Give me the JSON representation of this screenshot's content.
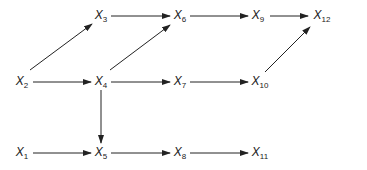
{
  "diagram": {
    "type": "directed-graph",
    "stroke_color": "#222222",
    "background": "#ffffff",
    "nodes": [
      {
        "id": "X1",
        "base": "X",
        "sub": "1",
        "x": 22,
        "y": 153
      },
      {
        "id": "X2",
        "base": "X",
        "sub": "2",
        "x": 22,
        "y": 82
      },
      {
        "id": "X3",
        "base": "X",
        "sub": "3",
        "x": 101,
        "y": 16
      },
      {
        "id": "X4",
        "base": "X",
        "sub": "4",
        "x": 101,
        "y": 82
      },
      {
        "id": "X5",
        "base": "X",
        "sub": "5",
        "x": 101,
        "y": 153
      },
      {
        "id": "X6",
        "base": "X",
        "sub": "6",
        "x": 180,
        "y": 16
      },
      {
        "id": "X7",
        "base": "X",
        "sub": "7",
        "x": 180,
        "y": 82
      },
      {
        "id": "X8",
        "base": "X",
        "sub": "8",
        "x": 180,
        "y": 153
      },
      {
        "id": "X9",
        "base": "X",
        "sub": "9",
        "x": 258,
        "y": 16
      },
      {
        "id": "X10",
        "base": "X",
        "sub": "10",
        "x": 260,
        "y": 82
      },
      {
        "id": "X11",
        "base": "X",
        "sub": "11",
        "x": 260,
        "y": 153
      },
      {
        "id": "X12",
        "base": "X",
        "sub": "12",
        "x": 322,
        "y": 16
      }
    ],
    "edges": [
      {
        "from": "X2",
        "to": "X3",
        "x1": 30,
        "y1": 70,
        "x2": 92,
        "y2": 24
      },
      {
        "from": "X2",
        "to": "X4",
        "x1": 33,
        "y1": 82,
        "x2": 91,
        "y2": 82
      },
      {
        "from": "X3",
        "to": "X6",
        "x1": 111,
        "y1": 16,
        "x2": 170,
        "y2": 16
      },
      {
        "from": "X4",
        "to": "X6",
        "x1": 110,
        "y1": 70,
        "x2": 170,
        "y2": 25
      },
      {
        "from": "X4",
        "to": "X7",
        "x1": 111,
        "y1": 82,
        "x2": 170,
        "y2": 82
      },
      {
        "from": "X4",
        "to": "X5",
        "x1": 101,
        "y1": 90,
        "x2": 101,
        "y2": 143
      },
      {
        "from": "X6",
        "to": "X9",
        "x1": 190,
        "y1": 16,
        "x2": 248,
        "y2": 16
      },
      {
        "from": "X9",
        "to": "X12",
        "x1": 270,
        "y1": 16,
        "x2": 308,
        "y2": 16
      },
      {
        "from": "X7",
        "to": "X10",
        "x1": 190,
        "y1": 82,
        "x2": 248,
        "y2": 82
      },
      {
        "from": "X10",
        "to": "X12",
        "x1": 265,
        "y1": 72,
        "x2": 310,
        "y2": 27
      },
      {
        "from": "X1",
        "to": "X5",
        "x1": 33,
        "y1": 153,
        "x2": 91,
        "y2": 153
      },
      {
        "from": "X5",
        "to": "X8",
        "x1": 111,
        "y1": 153,
        "x2": 170,
        "y2": 153
      },
      {
        "from": "X8",
        "to": "X11",
        "x1": 190,
        "y1": 153,
        "x2": 248,
        "y2": 153
      }
    ]
  }
}
